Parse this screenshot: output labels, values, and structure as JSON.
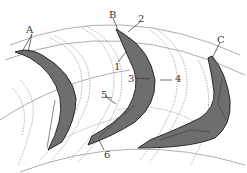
{
  "diagram": {
    "type": "turbine blade cascade cross-section",
    "colors": {
      "blade_fill": "#6e6e6e",
      "blade_edge": "#2a2a2a",
      "dashed_outline": "#9a9a9a",
      "background": "#ffffff"
    },
    "blades": [
      {
        "id": "A",
        "label": "A"
      },
      {
        "id": "B",
        "label": "B"
      },
      {
        "id": "C",
        "label": "C"
      }
    ],
    "labels": {
      "A": "A",
      "B": "B",
      "C": "C",
      "n1": "1",
      "n2": "2",
      "n3": "3",
      "n4": "4",
      "n5": "5",
      "n6": "6"
    }
  }
}
